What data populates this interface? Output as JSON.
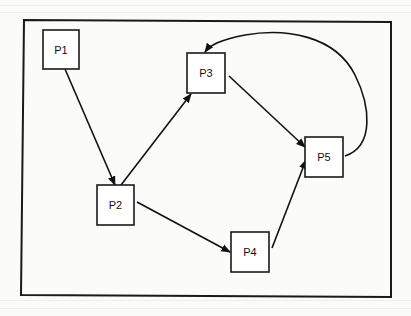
{
  "diagram": {
    "type": "directed-graph",
    "nodes": [
      {
        "id": "P1",
        "label": "P1"
      },
      {
        "id": "P2",
        "label": "P2"
      },
      {
        "id": "P3",
        "label": "P3"
      },
      {
        "id": "P4",
        "label": "P4"
      },
      {
        "id": "P5",
        "label": "P5"
      }
    ],
    "edges": [
      {
        "from": "P1",
        "to": "P2",
        "style": "straight"
      },
      {
        "from": "P2",
        "to": "P3",
        "style": "straight"
      },
      {
        "from": "P2",
        "to": "P4",
        "style": "straight"
      },
      {
        "from": "P3",
        "to": "P5",
        "style": "straight"
      },
      {
        "from": "P4",
        "to": "P5",
        "style": "straight"
      },
      {
        "from": "P5",
        "to": "P3",
        "style": "curved"
      }
    ],
    "colors": {
      "stroke": "#1a1a1a",
      "background": "#fbfbfa",
      "node_fill": "#ffffff"
    }
  }
}
